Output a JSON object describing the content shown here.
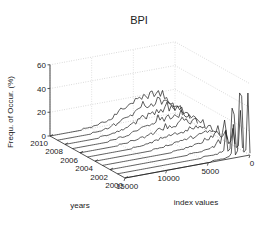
{
  "figure": {
    "title": "BPI",
    "type": "waterfall-3d"
  },
  "axes": {
    "z": {
      "label": "Frequ. of Occur. (%)",
      "ticks": [
        "0",
        "20",
        "40",
        "60"
      ],
      "tick_values": [
        0,
        20,
        40,
        60
      ],
      "range": [
        0,
        60
      ]
    },
    "y": {
      "label": "years",
      "ticks": [
        "2010",
        "2008",
        "2006",
        "2004",
        "2002",
        "2000"
      ],
      "tick_values": [
        2010,
        2008,
        2006,
        2004,
        2002,
        2000
      ],
      "range": [
        2000,
        2010
      ]
    },
    "x": {
      "label": "index values",
      "ticks": [
        "15000",
        "10000",
        "5000",
        "0"
      ],
      "tick_values": [
        15000,
        10000,
        5000,
        0
      ],
      "range": [
        0,
        15000
      ]
    }
  },
  "colors": {
    "line": "#1a1a1a",
    "grid": "#b4b4b4",
    "axis": "#555555",
    "background": "#ffffff"
  },
  "chart_data": {
    "type": "line",
    "title": "BPI",
    "xlabel": "index values",
    "ylabel": "years",
    "zlabel": "Frequ. of Occur. (%)",
    "xlim": [
      0,
      15000
    ],
    "ylim": [
      2000,
      2010
    ],
    "zlim": [
      0,
      60
    ],
    "grid": true,
    "legend": "none",
    "note": "3D waterfall / ridgeline: one frequency-of-occurrence curve per year, plotted against index values. Sharp tall spikes occur at low index values; noisy broad humps spread over mid index values in later years.",
    "x": [
      0,
      250,
      500,
      750,
      1000,
      1250,
      1500,
      1750,
      2000,
      2250,
      2500,
      2750,
      3000,
      3250,
      3500,
      3750,
      4000,
      4250,
      4500,
      4750,
      5000,
      5250,
      5500,
      5750,
      6000,
      6250,
      6500,
      6750,
      7000,
      7250,
      7500,
      7750,
      8000,
      8250,
      8500,
      8750,
      9000,
      9250,
      9500,
      9750,
      10000,
      10250,
      10500,
      10750,
      11000,
      11250,
      11500,
      11750,
      12000,
      12250,
      12500,
      12750,
      13000,
      13250,
      13500,
      13750,
      14000,
      14250,
      14500,
      14750,
      15000
    ],
    "series": [
      {
        "name": "2000",
        "values": [
          2,
          55,
          6,
          3,
          48,
          52,
          5,
          2,
          28,
          4,
          2,
          2,
          1,
          1,
          1,
          1,
          1,
          1,
          1,
          0,
          0,
          0,
          0,
          0,
          0,
          0,
          0,
          0,
          0,
          0,
          0,
          0,
          0,
          0,
          0,
          0,
          0,
          0,
          0,
          0,
          0,
          0,
          0,
          0,
          0,
          0,
          0,
          0,
          0,
          0,
          0,
          0,
          0,
          0,
          0,
          0,
          0,
          0,
          0,
          0,
          0
        ]
      },
      {
        "name": "2001",
        "values": [
          2,
          34,
          5,
          3,
          30,
          40,
          4,
          2,
          18,
          3,
          2,
          2,
          1,
          1,
          1,
          1,
          1,
          1,
          1,
          1,
          0,
          0,
          0,
          0,
          0,
          0,
          0,
          0,
          0,
          0,
          0,
          0,
          0,
          0,
          0,
          0,
          0,
          0,
          0,
          0,
          0,
          0,
          0,
          0,
          0,
          0,
          0,
          0,
          0,
          0,
          0,
          0,
          0,
          0,
          0,
          0,
          0,
          0,
          0,
          0,
          0
        ]
      },
      {
        "name": "2002",
        "values": [
          2,
          18,
          5,
          4,
          14,
          22,
          12,
          4,
          10,
          5,
          3,
          3,
          2,
          2,
          2,
          2,
          1,
          1,
          1,
          1,
          1,
          1,
          1,
          0,
          0,
          0,
          0,
          0,
          0,
          0,
          0,
          0,
          0,
          0,
          0,
          0,
          0,
          0,
          0,
          0,
          0,
          0,
          0,
          0,
          0,
          0,
          0,
          0,
          0,
          0,
          0,
          0,
          0,
          0,
          0,
          0,
          0,
          0,
          0,
          0,
          0
        ]
      },
      {
        "name": "2003",
        "values": [
          2,
          12,
          6,
          5,
          9,
          13,
          11,
          6,
          8,
          6,
          5,
          6,
          4,
          4,
          3,
          3,
          3,
          2,
          2,
          2,
          2,
          1,
          1,
          1,
          1,
          1,
          1,
          0,
          0,
          0,
          0,
          0,
          0,
          0,
          0,
          0,
          0,
          0,
          0,
          0,
          0,
          0,
          0,
          0,
          0,
          0,
          0,
          0,
          0,
          0,
          0,
          0,
          0,
          0,
          0,
          0,
          0,
          0,
          0,
          0,
          0
        ]
      },
      {
        "name": "2004",
        "values": [
          2,
          9,
          6,
          6,
          8,
          10,
          9,
          7,
          8,
          7,
          6,
          7,
          6,
          5,
          5,
          5,
          4,
          4,
          4,
          4,
          3,
          3,
          3,
          2,
          2,
          2,
          2,
          1,
          1,
          1,
          1,
          1,
          1,
          0,
          0,
          0,
          0,
          0,
          0,
          0,
          0,
          0,
          0,
          0,
          0,
          0,
          0,
          0,
          0,
          0,
          0,
          0,
          0,
          0,
          0,
          0,
          0,
          0,
          0,
          0,
          0
        ]
      },
      {
        "name": "2005",
        "values": [
          2,
          8,
          7,
          6,
          8,
          9,
          9,
          8,
          9,
          8,
          8,
          9,
          8,
          7,
          7,
          7,
          6,
          6,
          6,
          6,
          5,
          5,
          5,
          4,
          4,
          4,
          3,
          3,
          3,
          2,
          2,
          2,
          2,
          1,
          1,
          1,
          1,
          1,
          1,
          0,
          0,
          0,
          0,
          0,
          0,
          0,
          0,
          0,
          0,
          0,
          0,
          0,
          0,
          0,
          0,
          0,
          0,
          0,
          0,
          0,
          0
        ]
      },
      {
        "name": "2006",
        "values": [
          2,
          7,
          7,
          7,
          9,
          9,
          10,
          9,
          11,
          10,
          10,
          12,
          10,
          9,
          9,
          9,
          8,
          8,
          8,
          9,
          7,
          7,
          7,
          6,
          6,
          5,
          5,
          4,
          4,
          3,
          3,
          3,
          3,
          2,
          2,
          2,
          2,
          1,
          1,
          1,
          1,
          1,
          0,
          0,
          0,
          0,
          0,
          0,
          0,
          0,
          0,
          0,
          0,
          0,
          0,
          0,
          0,
          0,
          0,
          0,
          0
        ]
      },
      {
        "name": "2007",
        "values": [
          2,
          7,
          8,
          7,
          10,
          10,
          12,
          11,
          13,
          12,
          12,
          15,
          13,
          11,
          11,
          12,
          10,
          10,
          11,
          12,
          9,
          9,
          10,
          8,
          8,
          7,
          6,
          6,
          5,
          4,
          4,
          4,
          3,
          3,
          3,
          2,
          2,
          2,
          2,
          1,
          1,
          1,
          1,
          0,
          0,
          0,
          0,
          0,
          0,
          0,
          0,
          0,
          0,
          0,
          0,
          0,
          0,
          0,
          0,
          0,
          0
        ]
      },
      {
        "name": "2008",
        "values": [
          2,
          7,
          8,
          8,
          11,
          12,
          14,
          13,
          16,
          15,
          14,
          18,
          16,
          13,
          13,
          14,
          12,
          12,
          13,
          15,
          11,
          11,
          12,
          10,
          9,
          8,
          8,
          7,
          6,
          5,
          5,
          4,
          4,
          3,
          3,
          3,
          2,
          2,
          2,
          1,
          1,
          1,
          1,
          1,
          0,
          0,
          0,
          0,
          0,
          0,
          0,
          0,
          0,
          0,
          0,
          0,
          0,
          0,
          0,
          0,
          0
        ]
      },
      {
        "name": "2009",
        "values": [
          2,
          8,
          9,
          8,
          12,
          13,
          16,
          15,
          18,
          17,
          16,
          21,
          18,
          15,
          15,
          17,
          14,
          14,
          16,
          18,
          13,
          13,
          14,
          11,
          11,
          10,
          9,
          8,
          7,
          6,
          5,
          5,
          4,
          4,
          3,
          3,
          2,
          2,
          2,
          1,
          1,
          1,
          1,
          1,
          0,
          0,
          0,
          0,
          0,
          0,
          0,
          0,
          0,
          0,
          0,
          0,
          0,
          0,
          0,
          0,
          0
        ]
      },
      {
        "name": "2010",
        "values": [
          2,
          8,
          9,
          9,
          13,
          14,
          18,
          16,
          20,
          19,
          18,
          24,
          20,
          17,
          17,
          19,
          16,
          16,
          18,
          21,
          15,
          14,
          16,
          13,
          12,
          11,
          10,
          9,
          8,
          7,
          6,
          5,
          5,
          4,
          4,
          3,
          3,
          2,
          2,
          2,
          1,
          1,
          1,
          1,
          1,
          0,
          0,
          0,
          0,
          0,
          0,
          0,
          0,
          0,
          0,
          0,
          0,
          0,
          0,
          0,
          0
        ]
      }
    ]
  }
}
